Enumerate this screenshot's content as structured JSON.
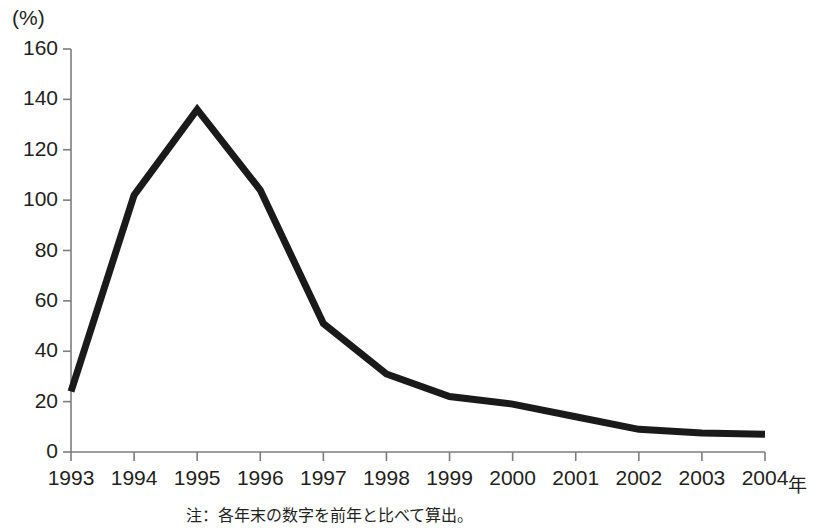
{
  "chart_data": {
    "type": "line",
    "title": "",
    "subtitle": "",
    "xlabel": "年",
    "ylabel": "(%)",
    "unit_label": "(%)",
    "categories": [
      "1993",
      "1994",
      "1995",
      "1996",
      "1997",
      "1998",
      "1999",
      "2000",
      "2001",
      "2002",
      "2003",
      "2004"
    ],
    "x": [
      1993,
      1994,
      1995,
      1996,
      1997,
      1998,
      1999,
      2000,
      2001,
      2002,
      2003,
      2004
    ],
    "values": [
      24,
      102,
      136,
      104,
      51,
      31,
      22,
      19,
      14,
      9,
      7.5,
      7
    ],
    "series": [
      {
        "name": "伸び率",
        "values": [
          24,
          102,
          136,
          104,
          51,
          31,
          22,
          19,
          14,
          9,
          7.5,
          7
        ]
      }
    ],
    "ylim": [
      0,
      160
    ],
    "xlim": [
      1993,
      2004
    ],
    "yticks": [
      0,
      20,
      40,
      60,
      80,
      100,
      120,
      140,
      160
    ],
    "ytick_labels": [
      "0",
      "20",
      "40",
      "60",
      "80",
      "100",
      "120",
      "140",
      "160"
    ],
    "xtick_labels": [
      "1993",
      "1994",
      "1995",
      "1996",
      "1997",
      "1998",
      "1999",
      "2000",
      "2001",
      "2002",
      "2003",
      "2004"
    ],
    "grid": false,
    "legend": "none",
    "line_color": "#1a1a1a",
    "axis_color": "#7d7d7d",
    "line_width": 7,
    "note": "注：各年末の数字を前年と比べて算出。"
  }
}
